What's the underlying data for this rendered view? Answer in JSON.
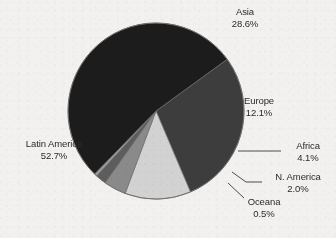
{
  "chart_data": {
    "type": "pie",
    "title": "",
    "xlabel": "",
    "ylabel": "",
    "legend_position": "none",
    "grid": false,
    "units": "percent",
    "total": 100.0,
    "categories": [
      "Asia",
      "Europe",
      "Africa",
      "N. America",
      "Oceana",
      "Latin America"
    ],
    "values": [
      28.6,
      12.1,
      4.1,
      2.0,
      0.5,
      52.7
    ],
    "slices": [
      {
        "label": "Asia",
        "value": 28.6,
        "value_text": "28.6%",
        "color": "#3d3d3d",
        "label_style": "outside"
      },
      {
        "label": "Europe",
        "value": 12.1,
        "value_text": "12.1%",
        "color": "#d2d2d2",
        "label_style": "inside"
      },
      {
        "label": "Africa",
        "value": 4.1,
        "value_text": "4.1%",
        "color": "#8a8a8a",
        "label_style": "leader"
      },
      {
        "label": "N. America",
        "value": 2.0,
        "value_text": "2.0%",
        "color": "#5d5d5d",
        "label_style": "leader"
      },
      {
        "label": "Oceana",
        "value": 0.5,
        "value_text": "0.5%",
        "color": "#9b9b9b",
        "label_style": "leader"
      },
      {
        "label": "Latin America",
        "value": 52.7,
        "value_text": "52.7%",
        "color": "#1c1c1c",
        "label_style": "outside"
      }
    ],
    "start_angle_deg": -36,
    "direction": "clockwise",
    "center": {
      "x": 156,
      "y": 111
    },
    "radius": 88
  },
  "colors": {
    "background": "#f2f1ef",
    "text": "#2b2b2b",
    "outline": "#6e6e6e",
    "leader_line": "#3a3a3a"
  },
  "labels": {
    "asia": {
      "name": "Asia",
      "value": "28.6%"
    },
    "europe": {
      "name": "Europe",
      "value": "12.1%"
    },
    "africa": {
      "name": "Africa",
      "value": "4.1%"
    },
    "namerica": {
      "name": "N. America",
      "value": "2.0%"
    },
    "oceana": {
      "name": "Oceana",
      "value": "0.5%"
    },
    "latinamerica": {
      "name": "Latin America",
      "value": "52.7%"
    }
  }
}
